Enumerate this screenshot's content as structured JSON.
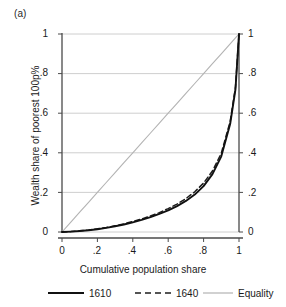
{
  "panel": {
    "label": "(a)"
  },
  "chart_data": {
    "type": "line",
    "title": "",
    "subtitle": "",
    "xlabel": "Cumulative population share",
    "ylabel": "Wealth share of poorest 100p%",
    "xlim": [
      0,
      1
    ],
    "ylim": [
      0,
      1
    ],
    "grid": "horizontal",
    "legend_position": "bottom",
    "xticks": [
      "0",
      ".2",
      ".4",
      ".6",
      ".8",
      "1"
    ],
    "xtick_values": [
      0,
      0.2,
      0.4,
      0.6,
      0.8,
      1
    ],
    "yticks": [
      "0",
      ".2",
      ".4",
      ".6",
      ".8",
      "1"
    ],
    "ytick_values": [
      0,
      0.2,
      0.4,
      0.6,
      0.8,
      1
    ],
    "yticks_right": [
      "0",
      ".2",
      ".4",
      ".6",
      ".8",
      "1"
    ],
    "x": [
      0,
      0.05,
      0.1,
      0.15,
      0.2,
      0.25,
      0.3,
      0.35,
      0.4,
      0.45,
      0.5,
      0.55,
      0.6,
      0.65,
      0.7,
      0.75,
      0.8,
      0.85,
      0.9,
      0.95,
      0.98,
      1
    ],
    "series": [
      {
        "name": "1610",
        "style": "solid",
        "color": "#111111",
        "values": [
          0,
          0.002,
          0.005,
          0.009,
          0.014,
          0.021,
          0.029,
          0.038,
          0.049,
          0.061,
          0.075,
          0.091,
          0.109,
          0.131,
          0.157,
          0.189,
          0.232,
          0.292,
          0.382,
          0.545,
          0.72,
          1
        ]
      },
      {
        "name": "1640",
        "style": "dashed",
        "color": "#1d1d1d",
        "values": [
          0,
          0.002,
          0.006,
          0.01,
          0.016,
          0.023,
          0.031,
          0.041,
          0.053,
          0.066,
          0.081,
          0.098,
          0.118,
          0.141,
          0.169,
          0.203,
          0.247,
          0.308,
          0.398,
          0.558,
          0.73,
          1
        ]
      },
      {
        "name": "Equality",
        "style": "solid-light",
        "color": "#b3b3b3",
        "values": [
          0,
          0.05,
          0.1,
          0.15,
          0.2,
          0.25,
          0.3,
          0.35,
          0.4,
          0.45,
          0.5,
          0.55,
          0.6,
          0.65,
          0.7,
          0.75,
          0.8,
          0.85,
          0.9,
          0.95,
          0.98,
          1
        ]
      }
    ],
    "legend": [
      {
        "label": "1610",
        "style": "solid",
        "color": "#111111"
      },
      {
        "label": "1640",
        "style": "dashed",
        "color": "#1d1d1d"
      },
      {
        "label": "Equality",
        "style": "solid-light",
        "color": "#b3b3b3"
      }
    ],
    "colors": {
      "axis": "#4a4a4a",
      "grid": "#c8c8c8",
      "background": "#ffffff",
      "text": "#1a1a1a"
    }
  }
}
